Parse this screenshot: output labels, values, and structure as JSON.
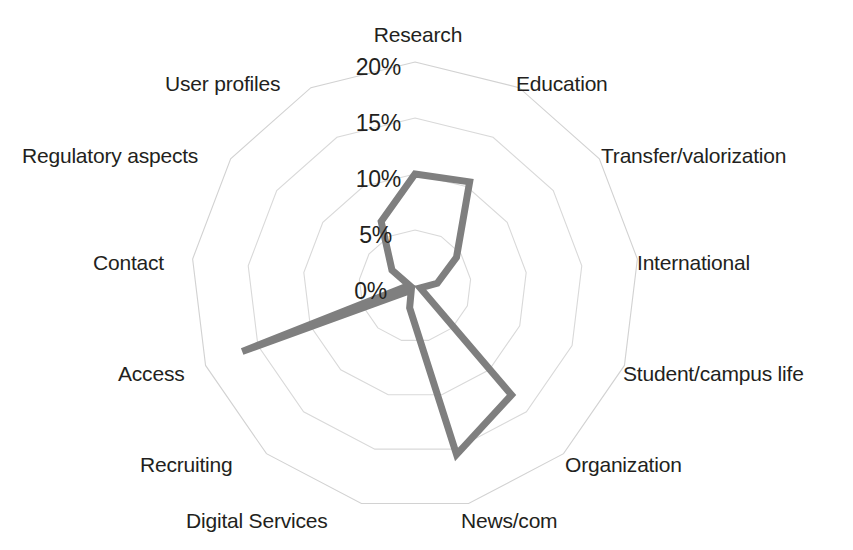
{
  "chart_data": {
    "type": "radar",
    "title": "",
    "subtitle": "",
    "xlabel": "",
    "ylabel": "",
    "grid": true,
    "legend": false,
    "legend_position": "none",
    "rlim": [
      0,
      20
    ],
    "tick_labels": [
      "0%",
      "5%",
      "10%",
      "15%",
      "20%"
    ],
    "tick_values": [
      0,
      5,
      10,
      15,
      20
    ],
    "rings": 4,
    "categories": [
      "Research",
      "Education",
      "Transfer/valorization",
      "International",
      "Student/campus life",
      "Organization",
      "News/com",
      "Digital Services",
      "Recruiting",
      "Access",
      "Contact",
      "Regulatory aspects",
      "User profiles"
    ],
    "series": [
      {
        "name": "Share of pages",
        "color": "#7f7f7f",
        "values": [
          10.0,
          10.5,
          4.5,
          2.0,
          0.5,
          13.0,
          15.5,
          2.0,
          0.5,
          16.5,
          0.5,
          2.5,
          6.5
        ]
      }
    ]
  },
  "axis_labels": {
    "research": "Research",
    "education": "Education",
    "transfer": "Transfer/valorization",
    "international": "International",
    "student": "Student/campus life",
    "organization": "Organization",
    "news": "News/com",
    "digital_services": "Digital Services",
    "recruiting": "Recruiting",
    "access": "Access",
    "contact": "Contact",
    "regulatory": "Regulatory aspects",
    "user_profiles": "User profiles"
  },
  "ticks": {
    "t0": "0%",
    "t5": "5%",
    "t10": "10%",
    "t15": "15%",
    "t20": "20%"
  },
  "colors": {
    "series": "#7f7f7f",
    "grid": "#d9d9d9",
    "text": "#231f20",
    "background": "#ffffff"
  }
}
